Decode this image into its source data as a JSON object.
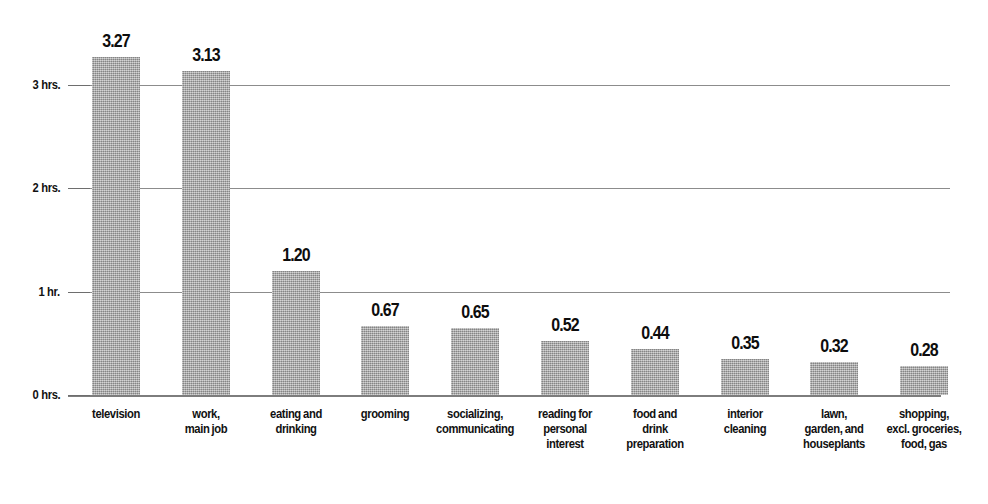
{
  "chart_data": {
    "type": "bar",
    "title": "",
    "subtitle": "",
    "xlabel": "",
    "ylabel": "",
    "ylim": [
      0,
      3.6
    ],
    "grid": true,
    "legend": false,
    "legend_position": "none",
    "orientation": "vertical",
    "bar_color": "#a8a8a8",
    "gridline_color": "#8c8c8c",
    "text_color": "#111111",
    "categories": [
      "television",
      "work,\nmain job",
      "eating and\ndrinking",
      "grooming",
      "socializing,\ncommunicating",
      "reading for\npersonal\ninterest",
      "food and\ndrink\npreparation",
      "interior\ncleaning",
      "lawn,\ngarden, and\nhouseplants",
      "shopping,\nexcl. groceries,\nfood, gas"
    ],
    "category_lines": [
      [
        "television"
      ],
      [
        "work,",
        "main job"
      ],
      [
        "eating and",
        "drinking"
      ],
      [
        "grooming"
      ],
      [
        "socializing,",
        "communicating"
      ],
      [
        "reading for",
        "personal",
        "interest"
      ],
      [
        "food and",
        "drink",
        "preparation"
      ],
      [
        "interior",
        "cleaning"
      ],
      [
        "lawn,",
        "garden, and",
        "houseplants"
      ],
      [
        "shopping,",
        "excl. groceries,",
        "food, gas"
      ]
    ],
    "values": [
      3.27,
      3.13,
      1.2,
      0.67,
      0.65,
      0.52,
      0.44,
      0.35,
      0.32,
      0.28
    ],
    "value_labels": [
      "3.27",
      "3.13",
      "1.20",
      "0.67",
      "0.65",
      "0.52",
      "0.44",
      "0.35",
      "0.32",
      "0.28"
    ],
    "yticks": [
      0,
      1,
      2,
      3
    ],
    "ytick_labels": [
      "0 hrs.",
      "1 hr.",
      "2 hrs.",
      "3 hrs."
    ]
  }
}
